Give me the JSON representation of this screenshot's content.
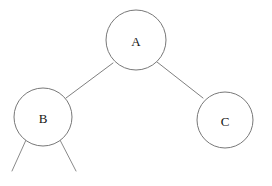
{
  "diagram": {
    "background_color": "#ffffff",
    "node_fill_color": "#ffffff",
    "node_stroke_color": "#787878",
    "edge_stroke_color": "#808080",
    "label_color": "#151515",
    "nodes": [
      {
        "id": "A",
        "label": "A",
        "cx": 136,
        "cy": 40,
        "r": 30
      },
      {
        "id": "B",
        "label": "B",
        "cx": 43,
        "cy": 117,
        "r": 29
      },
      {
        "id": "C",
        "label": "C",
        "cx": 225,
        "cy": 120,
        "r": 28
      }
    ],
    "edges": [
      {
        "id": "A-B",
        "from": "A",
        "to": "B",
        "x1": 113,
        "y1": 63,
        "x2": 66,
        "y2": 98
      },
      {
        "id": "A-C",
        "from": "A",
        "to": "C",
        "x1": 157,
        "y1": 62,
        "x2": 203,
        "y2": 98
      }
    ],
    "stubs": [
      {
        "id": "B-left-stub",
        "from": "B",
        "x1": 26,
        "y1": 140,
        "x2": 12,
        "y2": 171
      },
      {
        "id": "B-right-stub",
        "from": "B",
        "x1": 60,
        "y1": 140,
        "x2": 76,
        "y2": 171
      }
    ]
  }
}
